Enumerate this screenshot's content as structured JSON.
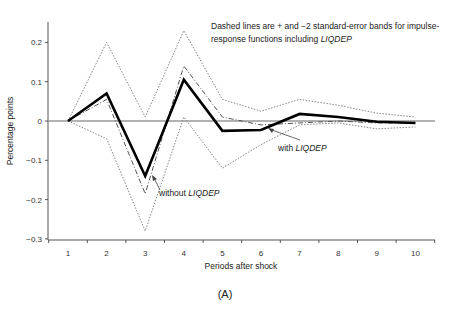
{
  "chart_data": {
    "type": "line",
    "title": "",
    "panel_label": "(A)",
    "xlabel": "Periods after shock",
    "ylabel": "Percentage points",
    "x": [
      1,
      2,
      3,
      4,
      5,
      6,
      7,
      8,
      9,
      10
    ],
    "xticks": [
      "1",
      "2",
      "3",
      "4",
      "5",
      "6",
      "7",
      "8",
      "9",
      "10"
    ],
    "yticks": [
      "0.2",
      "0.1",
      "0",
      "-0.1",
      "-0.2",
      "-0.3"
    ],
    "ylim": [
      -0.3,
      0.25
    ],
    "grid": false,
    "note_line1": "Dashed lines are + and −2 standard-error bands for impulse-",
    "note_line2_prefix": "response functions including ",
    "note_line2_ital": "LIQDEP",
    "series": [
      {
        "name": "with LIQDEP",
        "style": "solid-thick",
        "values": [
          0,
          0.07,
          -0.14,
          0.105,
          -0.025,
          -0.023,
          0.018,
          0.01,
          -0.002,
          -0.005
        ]
      },
      {
        "name": "without LIQDEP",
        "style": "dash-dot",
        "values": [
          0,
          0.055,
          -0.185,
          0.14,
          0.01,
          -0.01,
          -0.005,
          0.0,
          -0.005,
          -0.005
        ]
      },
      {
        "name": "+2 SE band",
        "style": "dotted",
        "values": [
          0,
          0.2,
          0.01,
          0.23,
          0.055,
          0.025,
          0.055,
          0.04,
          0.02,
          0.01
        ]
      },
      {
        "name": "-2 SE band",
        "style": "dotted",
        "values": [
          0,
          -0.045,
          -0.28,
          0.01,
          -0.12,
          -0.06,
          -0.01,
          -0.005,
          -0.02,
          -0.015
        ]
      }
    ],
    "annotations": [
      {
        "prefix": "with ",
        "ital": "LIQDEP",
        "points_to_period": 6
      },
      {
        "prefix": "without ",
        "ital": "LIQDEP",
        "points_to_period": 3
      }
    ]
  }
}
